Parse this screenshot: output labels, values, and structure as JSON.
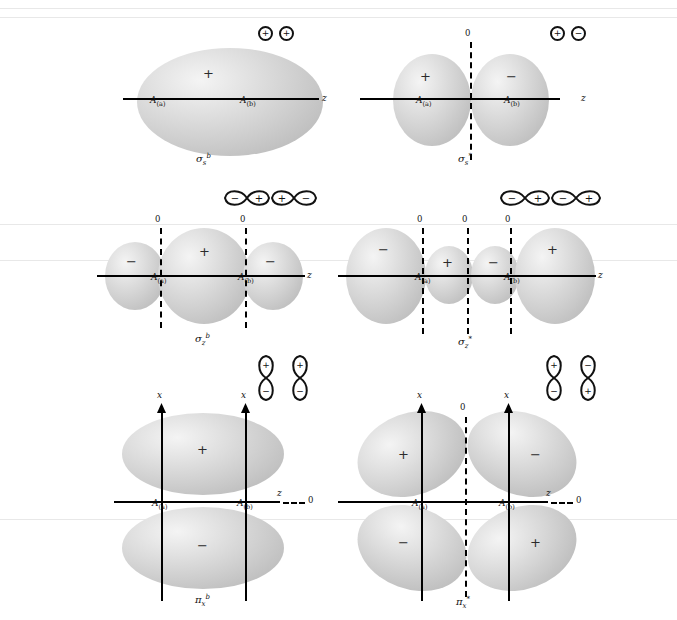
{
  "figure": {
    "type": "molecular-orbital-diagram-set",
    "atom_label_a": "A",
    "atom_label_a_sub": "(a)",
    "atom_label_b": "A",
    "atom_label_b_sub": "(b)",
    "axis_z": "z",
    "axis_x": "x",
    "node_marker": "0",
    "plus": "+",
    "minus": "−"
  },
  "panels": [
    {
      "id": "sigma-s-bonding",
      "mo_symbol": "σ",
      "mo_sub": "s",
      "mo_sup": "b",
      "lobe_signs": [
        "+"
      ],
      "node_markers": [],
      "axis_label": "z",
      "ao_icons": [
        {
          "kind": "s",
          "sign": "+"
        },
        {
          "kind": "s",
          "sign": "+"
        }
      ]
    },
    {
      "id": "sigma-s-antibonding",
      "mo_symbol": "σ",
      "mo_sub": "s",
      "mo_sup": "*",
      "lobe_signs": [
        "+",
        "−"
      ],
      "node_markers": [
        "0"
      ],
      "axis_label": "z",
      "ao_icons": [
        {
          "kind": "s",
          "sign": "+"
        },
        {
          "kind": "s",
          "sign": "−"
        }
      ]
    },
    {
      "id": "sigma-z-bonding",
      "mo_symbol": "σ",
      "mo_sub": "z",
      "mo_sup": "b",
      "lobe_signs": [
        "−",
        "+",
        "−"
      ],
      "node_markers": [
        "0",
        "0"
      ],
      "axis_label": "z",
      "ao_icons": [
        {
          "kind": "p-horizontal",
          "signs": [
            "−",
            "+"
          ]
        },
        {
          "kind": "p-horizontal",
          "signs": [
            "+",
            "−"
          ]
        }
      ]
    },
    {
      "id": "sigma-z-antibonding",
      "mo_symbol": "σ",
      "mo_sub": "z",
      "mo_sup": "*",
      "lobe_signs": [
        "−",
        "+",
        "−",
        "+"
      ],
      "node_markers": [
        "0",
        "0",
        "0"
      ],
      "axis_label": "z",
      "ao_icons": [
        {
          "kind": "p-horizontal",
          "signs": [
            "−",
            "+"
          ]
        },
        {
          "kind": "p-horizontal",
          "signs": [
            "−",
            "+"
          ]
        }
      ]
    },
    {
      "id": "pi-x-bonding",
      "mo_symbol": "π",
      "mo_sub": "x",
      "mo_sup": "b",
      "lobe_signs": [
        "+",
        "−"
      ],
      "node_markers": [
        "0"
      ],
      "axis_label": "z",
      "vertical_axis_label": "x",
      "ao_icons": [
        {
          "kind": "p-vertical",
          "signs": [
            "+",
            "−"
          ]
        },
        {
          "kind": "p-vertical",
          "signs": [
            "+",
            "−"
          ]
        }
      ]
    },
    {
      "id": "pi-x-antibonding",
      "mo_symbol": "π",
      "mo_sub": "x",
      "mo_sup": "*",
      "lobe_signs": [
        "+",
        "−",
        "−",
        "+"
      ],
      "node_markers": [
        "0",
        "0"
      ],
      "axis_label": "z",
      "vertical_axis_label": "x",
      "ao_icons": [
        {
          "kind": "p-vertical",
          "signs": [
            "+",
            "−"
          ]
        },
        {
          "kind": "p-vertical",
          "signs": [
            "−",
            "+"
          ]
        }
      ]
    }
  ]
}
